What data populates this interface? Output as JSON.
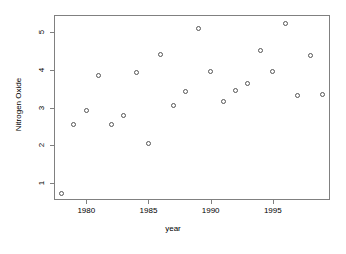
{
  "chart_data": {
    "type": "scatter",
    "title": "",
    "xlabel": "year",
    "ylabel": "Nitrogen Oxide",
    "xlim": [
      1977.4,
      1999.6
    ],
    "ylim": [
      0.55,
      5.45
    ],
    "grid": false,
    "legend": null,
    "xticks": [
      1980,
      1985,
      1990,
      1995
    ],
    "xtick_labels": [
      "1980",
      "1985",
      "1990",
      "1995"
    ],
    "yticks": [
      1,
      2,
      3,
      4,
      5
    ],
    "ytick_labels": [
      "1",
      "2",
      "3",
      "4",
      "5"
    ],
    "marker": "open-circle",
    "marker_color": "#555555",
    "x": [
      1978,
      1979,
      1980,
      1981,
      1982,
      1983,
      1984,
      1985,
      1986,
      1987,
      1988,
      1989,
      1990,
      1991,
      1992,
      1993,
      1994,
      1995,
      1996,
      1997,
      1998,
      1999
    ],
    "y": [
      0.73,
      2.56,
      2.92,
      3.84,
      2.55,
      2.79,
      3.94,
      2.04,
      4.4,
      3.06,
      3.42,
      5.08,
      3.96,
      3.16,
      3.46,
      3.63,
      4.51,
      3.96,
      5.23,
      3.32,
      4.37,
      3.34
    ],
    "points": [
      {
        "year": 1978,
        "value": 0.73
      },
      {
        "year": 1979,
        "value": 2.56
      },
      {
        "year": 1980,
        "value": 2.92
      },
      {
        "year": 1981,
        "value": 3.84
      },
      {
        "year": 1982,
        "value": 2.55
      },
      {
        "year": 1983,
        "value": 2.79
      },
      {
        "year": 1984,
        "value": 3.94
      },
      {
        "year": 1985,
        "value": 2.04
      },
      {
        "year": 1986,
        "value": 4.4
      },
      {
        "year": 1987,
        "value": 3.06
      },
      {
        "year": 1988,
        "value": 3.42
      },
      {
        "year": 1989,
        "value": 5.08
      },
      {
        "year": 1990,
        "value": 3.96
      },
      {
        "year": 1991,
        "value": 3.16
      },
      {
        "year": 1992,
        "value": 3.46
      },
      {
        "year": 1993,
        "value": 3.63
      },
      {
        "year": 1994,
        "value": 4.51
      },
      {
        "year": 1995,
        "value": 3.96
      },
      {
        "year": 1996,
        "value": 5.23
      },
      {
        "year": 1997,
        "value": 3.32
      },
      {
        "year": 1998,
        "value": 4.37
      },
      {
        "year": 1999,
        "value": 3.34
      }
    ]
  },
  "axes": {
    "x_title": "year",
    "y_title": "Nitrogen Oxide"
  }
}
